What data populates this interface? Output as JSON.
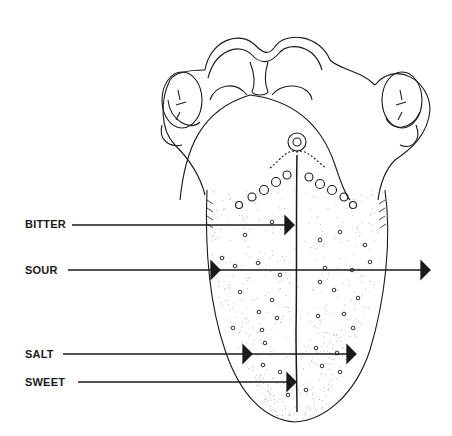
{
  "diagram": {
    "labels": [
      {
        "id": "bitter",
        "text": "BITTER",
        "x": 25,
        "y": 218,
        "line_end_x": 292,
        "arrow_y": 225,
        "arrows": [
          292
        ]
      },
      {
        "id": "sour",
        "text": "SOUR",
        "x": 25,
        "y": 264,
        "line_end_x": 428,
        "arrow_y": 270,
        "arrows": [
          218,
          428
        ]
      },
      {
        "id": "salt",
        "text": "SALT",
        "x": 25,
        "y": 348,
        "line_end_x": 354,
        "arrow_y": 354,
        "arrows": [
          250,
          354
        ]
      },
      {
        "id": "sweet",
        "text": "SWEET",
        "x": 25,
        "y": 376,
        "line_end_x": 294,
        "arrow_y": 382,
        "arrows": [
          294
        ]
      }
    ],
    "colors": {
      "ink": "#1a1a1a",
      "background": "#ffffff",
      "stipple": "#777777"
    }
  }
}
